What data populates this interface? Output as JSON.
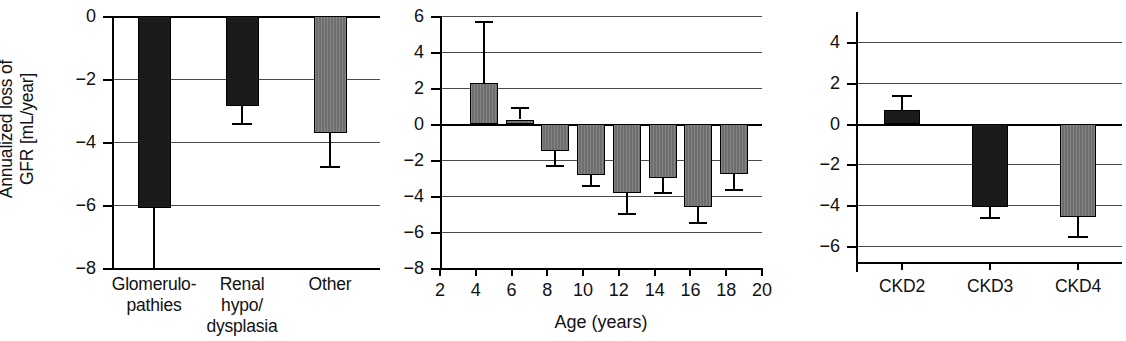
{
  "figure": {
    "yaxis_title_line1": "Annualized loss of",
    "yaxis_title_line2": "GFR [mL/year]",
    "bar_color_black": "#1b1b1b",
    "bar_color_gray": "#6e6e6e",
    "axis_color": "#000000",
    "grid_color": "#4a4a4a",
    "background": "#ffffff"
  },
  "chart_data": [
    {
      "type": "bar",
      "panel": 1,
      "title": "",
      "xlabel": "",
      "ylabel": "Annualized loss of GFR [mL/year]",
      "ylim": [
        -8,
        0
      ],
      "yticks": [
        0,
        -2,
        -4,
        -6,
        -8
      ],
      "ytick_labels": [
        "0",
        "−2",
        "−4",
        "−6",
        "−8"
      ],
      "grid": true,
      "categories": [
        "Glomerulo-pathies",
        "Renal hypo/dysplasia",
        "Other"
      ],
      "category_lines": [
        [
          "Glomerulo-",
          "pathies"
        ],
        [
          "Renal",
          "hypo/",
          "dysplasia"
        ],
        [
          "Other"
        ]
      ],
      "values": [
        -6.1,
        -2.85,
        -3.7
      ],
      "error_low": [
        -8.0,
        -3.4,
        -4.75
      ],
      "fills": [
        "black",
        "black",
        "gray"
      ]
    },
    {
      "type": "bar",
      "panel": 2,
      "title": "",
      "xlabel": "Age (years)",
      "ylabel": "",
      "ylim": [
        -8,
        6
      ],
      "yticks": [
        6,
        4,
        2,
        0,
        -2,
        -4,
        -6,
        -8
      ],
      "ytick_labels": [
        "6",
        "4",
        "2",
        "0",
        "−2",
        "−4",
        "−6",
        "−8"
      ],
      "xticks": [
        2,
        4,
        6,
        8,
        10,
        12,
        14,
        16,
        18,
        20
      ],
      "xtick_labels": [
        "2",
        "4",
        "6",
        "8",
        "10",
        "12",
        "14",
        "16",
        "18",
        "20"
      ],
      "xlim": [
        2,
        20
      ],
      "grid": true,
      "x": [
        4,
        6,
        8,
        10,
        12,
        14,
        16,
        18
      ],
      "values": [
        2.3,
        0.25,
        -1.5,
        -2.85,
        -3.85,
        -3.0,
        -4.6,
        -2.8
      ],
      "error_outer": [
        5.75,
        0.95,
        -2.25,
        -3.4,
        -4.95,
        -3.75,
        -5.45,
        -3.6
      ],
      "fills": [
        "gray",
        "gray",
        "gray",
        "gray",
        "gray",
        "gray",
        "gray",
        "gray"
      ]
    },
    {
      "type": "bar",
      "panel": 3,
      "title": "",
      "xlabel": "",
      "ylabel": "",
      "ylim": [
        -6.8,
        5
      ],
      "yticks": [
        4,
        2,
        0,
        -2,
        -4,
        -6
      ],
      "ytick_labels": [
        "4",
        "2",
        "0",
        "−2",
        "−4",
        "−6"
      ],
      "grid": true,
      "categories": [
        "CKD2",
        "CKD3",
        "CKD4"
      ],
      "values": [
        0.65,
        -4.1,
        -4.6
      ],
      "error_outer": [
        1.4,
        -4.6,
        -5.5
      ],
      "fills": [
        "black",
        "black",
        "gray"
      ]
    }
  ]
}
